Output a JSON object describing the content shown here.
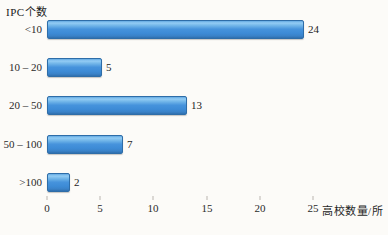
{
  "chart_data": {
    "type": "bar",
    "orientation": "horizontal",
    "ylabel": "IPC个数",
    "xlabel": "高校数量/所",
    "categories": [
      "<10",
      "10 – 20",
      "20 – 50",
      "50 – 100",
      ">100"
    ],
    "values": [
      24,
      5,
      13,
      7,
      2
    ],
    "xticks": [
      0,
      5,
      10,
      15,
      20,
      25
    ],
    "xlim": [
      0,
      25
    ],
    "grid": false,
    "bar_color_main": "#3f8ed8",
    "bar_color_highlight": "#93ccf4",
    "bar_color_edge": "#2e6da8",
    "background_color": "#fcfbf8"
  }
}
